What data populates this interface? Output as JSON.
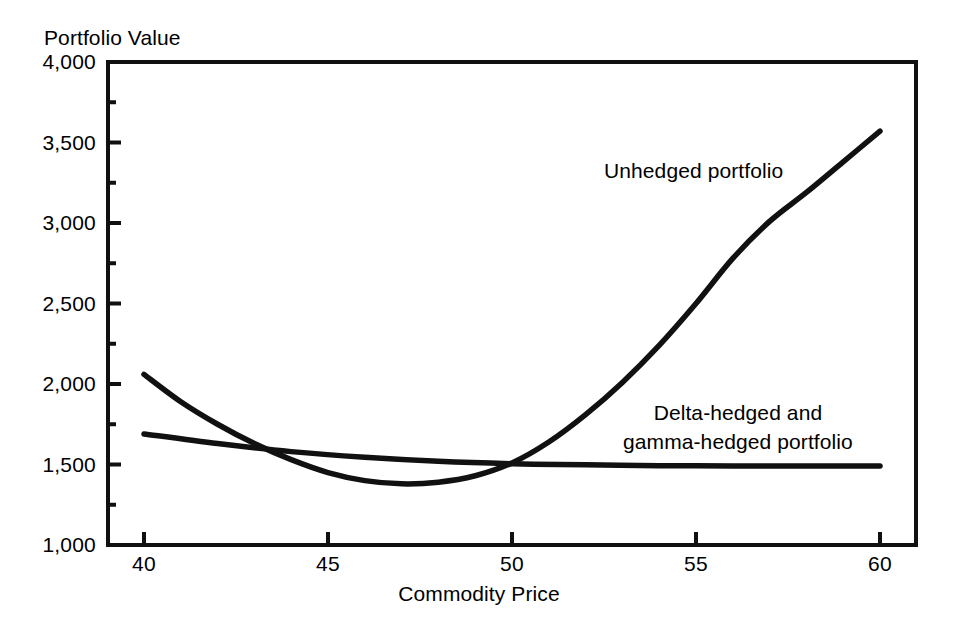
{
  "chart_data": {
    "type": "line",
    "title": "",
    "xlabel": "Commodity Price",
    "ylabel": "Portfolio Value",
    "xlim": [
      40,
      60
    ],
    "ylim": [
      1000,
      4000
    ],
    "xticks": [
      40,
      45,
      50,
      55,
      60
    ],
    "xtick_labels": [
      "40",
      "45",
      "50",
      "55",
      "60"
    ],
    "yticks": [
      1000,
      1500,
      2000,
      2500,
      3000,
      3500,
      4000
    ],
    "ytick_labels": [
      "1,000",
      "1,500",
      "2,000",
      "2,500",
      "3,000",
      "3,500",
      "4,000"
    ],
    "minor_yticks": [
      1250,
      1750,
      2250,
      2750,
      3250,
      3750
    ],
    "grid": false,
    "legend_position": "inline-annotations",
    "line_color": "#111111",
    "background_color": "#ffffff",
    "series": [
      {
        "name": "Unhedged portfolio",
        "label_text": "Unhedged portfolio",
        "x": [
          40,
          41,
          42,
          43,
          44,
          45,
          46,
          47,
          48,
          49,
          50,
          51,
          52,
          53,
          54,
          55,
          56,
          57,
          58,
          59,
          60
        ],
        "values": [
          2060,
          1890,
          1750,
          1630,
          1530,
          1450,
          1400,
          1380,
          1390,
          1430,
          1510,
          1640,
          1810,
          2010,
          2240,
          2500,
          2780,
          3010,
          3190,
          3380,
          3570
        ]
      },
      {
        "name": "Delta-hedged and gamma-hedged portfolio",
        "label_line1": "Delta-hedged and",
        "label_line2": "gamma-hedged portfolio",
        "x": [
          40,
          42,
          44,
          46,
          48,
          50,
          52,
          54,
          56,
          58,
          60
        ],
        "values": [
          1690,
          1630,
          1580,
          1545,
          1520,
          1505,
          1498,
          1493,
          1491,
          1490,
          1490
        ]
      }
    ]
  },
  "axes": {
    "y_title": "Portfolio Value",
    "x_title": "Commodity Price"
  },
  "annotations": {
    "unhedged": "Unhedged portfolio",
    "hedged_line1": "Delta-hedged and",
    "hedged_line2": "gamma-hedged portfolio"
  },
  "ytick_labels": {
    "t4000": "4,000",
    "t3500": "3,500",
    "t3000": "3,000",
    "t2500": "2,500",
    "t2000": "2,000",
    "t1500": "1,500",
    "t1000": "1,000"
  },
  "xtick_labels": {
    "t40": "40",
    "t45": "45",
    "t50": "50",
    "t55": "55",
    "t60": "60"
  }
}
